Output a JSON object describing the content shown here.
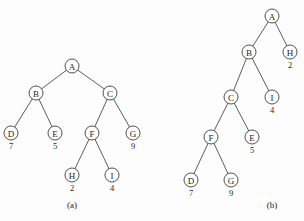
{
  "figure": {
    "width": 304,
    "height": 221,
    "background_color": "#fdfdfd",
    "stroke_color": "#3d3d3d",
    "text_color": "#1c1c1c",
    "node_radius": 7
  },
  "panels": [
    {
      "id": "panel-a",
      "caption": "(a)",
      "caption_x": 72,
      "caption_y": 205,
      "nodes": [
        {
          "id": "a-A",
          "label": "A",
          "value": "",
          "x": 72,
          "y": 66
        },
        {
          "id": "a-B",
          "label": "B",
          "value": "",
          "x": 36,
          "y": 93
        },
        {
          "id": "a-C",
          "label": "C",
          "value": "",
          "x": 110,
          "y": 93
        },
        {
          "id": "a-D",
          "label": "D",
          "value": "7",
          "x": 11,
          "y": 133
        },
        {
          "id": "a-E",
          "label": "E",
          "value": "5",
          "x": 55,
          "y": 133
        },
        {
          "id": "a-F",
          "label": "F",
          "value": "",
          "x": 92,
          "y": 133
        },
        {
          "id": "a-G",
          "label": "G",
          "value": "9",
          "x": 133,
          "y": 133
        },
        {
          "id": "a-H",
          "label": "H",
          "value": "2",
          "x": 72,
          "y": 175
        },
        {
          "id": "a-I",
          "label": "I",
          "value": "4",
          "x": 112,
          "y": 175
        }
      ],
      "edges": [
        {
          "from": "a-A",
          "to": "a-B"
        },
        {
          "from": "a-A",
          "to": "a-C"
        },
        {
          "from": "a-B",
          "to": "a-D"
        },
        {
          "from": "a-B",
          "to": "a-E"
        },
        {
          "from": "a-C",
          "to": "a-F"
        },
        {
          "from": "a-C",
          "to": "a-G"
        },
        {
          "from": "a-F",
          "to": "a-H"
        },
        {
          "from": "a-F",
          "to": "a-I"
        }
      ]
    },
    {
      "id": "panel-b",
      "caption": "(b)",
      "caption_x": 272,
      "caption_y": 205,
      "nodes": [
        {
          "id": "b-A",
          "label": "A",
          "value": "",
          "x": 272,
          "y": 16
        },
        {
          "id": "b-B",
          "label": "B",
          "value": "",
          "x": 249,
          "y": 52
        },
        {
          "id": "b-H",
          "label": "H",
          "value": "2",
          "x": 290,
          "y": 52
        },
        {
          "id": "b-C",
          "label": "C",
          "value": "",
          "x": 231,
          "y": 97
        },
        {
          "id": "b-I",
          "label": "I",
          "value": "4",
          "x": 272,
          "y": 97
        },
        {
          "id": "b-F",
          "label": "F",
          "value": "",
          "x": 211,
          "y": 137
        },
        {
          "id": "b-E",
          "label": "E",
          "value": "5",
          "x": 252,
          "y": 137
        },
        {
          "id": "b-D",
          "label": "D",
          "value": "7",
          "x": 191,
          "y": 180
        },
        {
          "id": "b-G",
          "label": "G",
          "value": "9",
          "x": 231,
          "y": 180
        }
      ],
      "edges": [
        {
          "from": "b-A",
          "to": "b-B"
        },
        {
          "from": "b-A",
          "to": "b-H"
        },
        {
          "from": "b-B",
          "to": "b-C"
        },
        {
          "from": "b-B",
          "to": "b-I"
        },
        {
          "from": "b-C",
          "to": "b-F"
        },
        {
          "from": "b-C",
          "to": "b-E"
        },
        {
          "from": "b-F",
          "to": "b-D"
        },
        {
          "from": "b-F",
          "to": "b-G"
        }
      ]
    }
  ]
}
